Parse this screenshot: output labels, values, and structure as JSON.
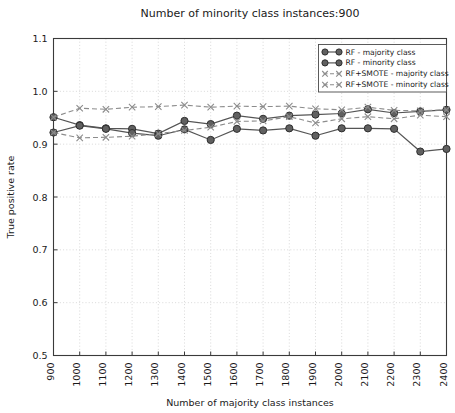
{
  "chart_data": {
    "type": "line",
    "title": "Number of minority class instances:900",
    "xlabel": "Number of majority class instances",
    "ylabel": "True positive rate",
    "x": [
      900,
      1000,
      1100,
      1200,
      1300,
      1400,
      1500,
      1600,
      1700,
      1800,
      1900,
      2000,
      2100,
      2200,
      2300,
      2400
    ],
    "categories": [
      "900",
      "1000",
      "1100",
      "1200",
      "1300",
      "1400",
      "1500",
      "1600",
      "1700",
      "1800",
      "1900",
      "2000",
      "2100",
      "2200",
      "2300",
      "2400"
    ],
    "xlim": [
      900,
      2400
    ],
    "ylim": [
      0.5,
      1.1
    ],
    "yticks": [
      0.5,
      0.6,
      0.7,
      0.8,
      0.9,
      1.0,
      1.1
    ],
    "ytick_labels": [
      "0.5",
      "0.6",
      "0.7",
      "0.8",
      "0.9",
      "1.0",
      "1.1"
    ],
    "grid": true,
    "grid_style": "dotted",
    "legend_position": "upper right",
    "series": [
      {
        "name": "RF - majority class",
        "color": "#555555",
        "linestyle": "solid",
        "marker": "circle",
        "values": [
          0.951,
          0.936,
          0.93,
          0.929,
          0.92,
          0.944,
          0.938,
          0.954,
          0.948,
          0.954,
          0.956,
          0.958,
          0.966,
          0.959,
          0.962,
          0.965
        ]
      },
      {
        "name": "RF - minority class",
        "color": "#555555",
        "linestyle": "solid",
        "marker": "circle",
        "values": [
          0.922,
          0.935,
          0.929,
          0.921,
          0.916,
          0.928,
          0.908,
          0.929,
          0.926,
          0.93,
          0.916,
          0.93,
          0.93,
          0.929,
          0.886,
          0.891
        ]
      },
      {
        "name": "RF+SMOTE - majority class",
        "color": "#8c8c8c",
        "linestyle": "dashed",
        "marker": "x",
        "values": [
          0.951,
          0.968,
          0.966,
          0.97,
          0.971,
          0.974,
          0.97,
          0.972,
          0.971,
          0.972,
          0.967,
          0.965,
          0.97,
          0.964,
          0.963,
          0.965
        ]
      },
      {
        "name": "RF+SMOTE - minority class",
        "color": "#8c8c8c",
        "linestyle": "dashed",
        "marker": "x",
        "values": [
          0.922,
          0.912,
          0.913,
          0.915,
          0.92,
          0.926,
          0.932,
          0.943,
          0.944,
          0.952,
          0.94,
          0.948,
          0.952,
          0.948,
          0.955,
          0.952
        ]
      }
    ]
  },
  "axes": {
    "title": "Number of minority class instances:900",
    "xlabel": "Number of majority class instances",
    "ylabel": "True positive rate"
  },
  "legend": {
    "items": [
      {
        "label": "RF - majority class"
      },
      {
        "label": "RF - minority class"
      },
      {
        "label": "RF+SMOTE - majority class"
      },
      {
        "label": "RF+SMOTE - minority class"
      }
    ]
  }
}
